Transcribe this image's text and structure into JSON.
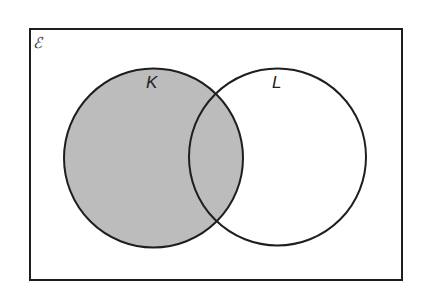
{
  "diagram": {
    "type": "venn",
    "universal_set": {
      "label": "ℰ"
    },
    "sets": [
      {
        "id": "K",
        "label": "K",
        "shaded": true
      },
      {
        "id": "L",
        "label": "L",
        "shaded": false
      }
    ],
    "shaded_region": "K",
    "colors": {
      "shade": "#bcbcbc",
      "stroke": "#1e1e1e",
      "background": "#ffffff"
    }
  }
}
